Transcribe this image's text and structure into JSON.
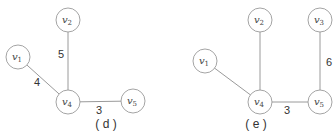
{
  "panels": [
    {
      "caption": "( d )",
      "nodes": [
        {
          "id": "v1",
          "base": "v",
          "sub": "1"
        },
        {
          "id": "v2",
          "base": "v",
          "sub": "2"
        },
        {
          "id": "v4",
          "base": "v",
          "sub": "4"
        },
        {
          "id": "v5",
          "base": "v",
          "sub": "5"
        }
      ],
      "edges": [
        {
          "from": "v1",
          "to": "v4",
          "weight": "4"
        },
        {
          "from": "v2",
          "to": "v4",
          "weight": "5"
        },
        {
          "from": "v4",
          "to": "v5",
          "weight": "3"
        }
      ]
    },
    {
      "caption": "( e )",
      "nodes": [
        {
          "id": "v1",
          "base": "v",
          "sub": "1"
        },
        {
          "id": "v2",
          "base": "v",
          "sub": "2"
        },
        {
          "id": "v3",
          "base": "v",
          "sub": "3"
        },
        {
          "id": "v4",
          "base": "v",
          "sub": "4"
        },
        {
          "id": "v5",
          "base": "v",
          "sub": "5"
        }
      ],
      "edges": [
        {
          "from": "v1",
          "to": "v4",
          "weight": ""
        },
        {
          "from": "v2",
          "to": "v4",
          "weight": ""
        },
        {
          "from": "v3",
          "to": "v5",
          "weight": "6"
        },
        {
          "from": "v4",
          "to": "v5",
          "weight": "3"
        }
      ]
    }
  ]
}
